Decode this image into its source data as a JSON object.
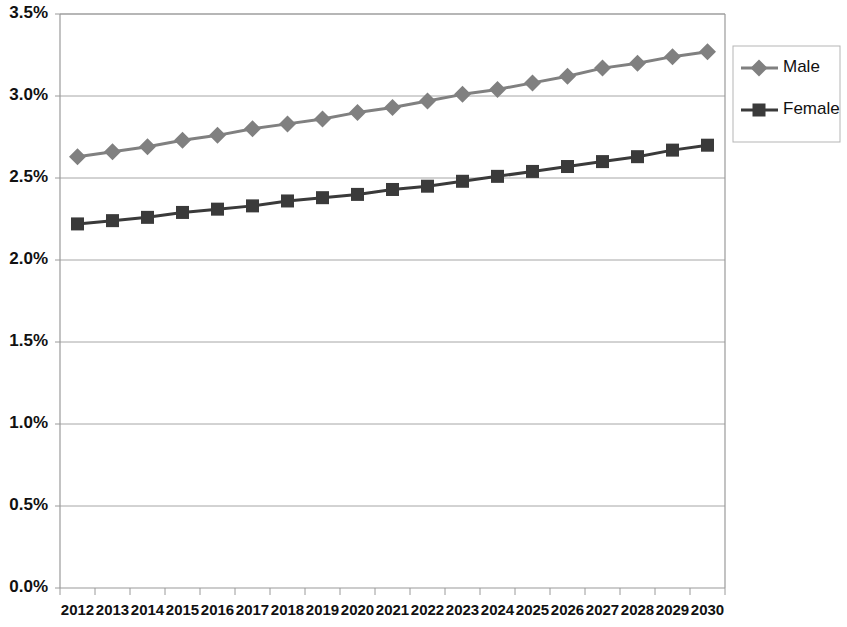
{
  "chart_data": {
    "type": "line",
    "title": "",
    "subtitle": "",
    "xlabel": "",
    "ylabel": "",
    "grid": true,
    "legend_position": "right",
    "categories": [
      "2012",
      "2013",
      "2014",
      "2015",
      "2016",
      "2017",
      "2018",
      "2019",
      "2020",
      "2021",
      "2022",
      "2023",
      "2024",
      "2025",
      "2026",
      "2027",
      "2028",
      "2029",
      "2030"
    ],
    "ylim": [
      0.0,
      3.5
    ],
    "ytick_labels": [
      "0.0%",
      "0.5%",
      "1.0%",
      "1.5%",
      "2.0%",
      "2.5%",
      "3.0%",
      "3.5%"
    ],
    "ytick_values": [
      0.0,
      0.5,
      1.0,
      1.5,
      2.0,
      2.5,
      3.0,
      3.5
    ],
    "series": [
      {
        "name": "Male",
        "color": "#808080",
        "marker": "diamond",
        "values": [
          2.63,
          2.66,
          2.69,
          2.73,
          2.76,
          2.8,
          2.83,
          2.86,
          2.9,
          2.93,
          2.97,
          3.01,
          3.04,
          3.08,
          3.12,
          3.17,
          3.2,
          3.24,
          3.27
        ]
      },
      {
        "name": "Female",
        "color": "#3a3a3a",
        "marker": "square",
        "values": [
          2.22,
          2.24,
          2.26,
          2.29,
          2.31,
          2.33,
          2.36,
          2.38,
          2.4,
          2.43,
          2.45,
          2.48,
          2.51,
          2.54,
          2.57,
          2.6,
          2.63,
          2.67,
          2.7
        ]
      }
    ]
  },
  "legend": {
    "entries": [
      {
        "label": "Male"
      },
      {
        "label": "Female"
      }
    ]
  },
  "colors": {
    "male": "#808080",
    "female": "#3a3a3a",
    "gridline": "#a6a6a6",
    "axis": "#9a9a9a",
    "text": "#111111",
    "background": "#ffffff"
  }
}
